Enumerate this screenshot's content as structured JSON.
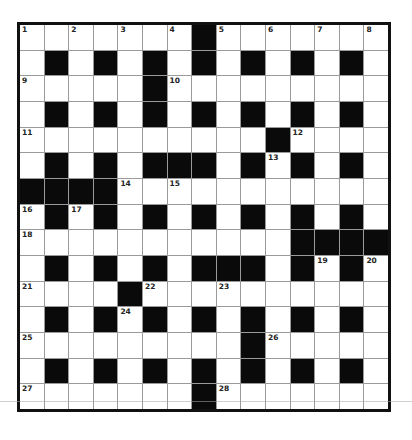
{
  "puzzle": {
    "rows": 15,
    "cols": 15,
    "layout": [
      "WWWWWWWBWWWWWWW",
      "WBWBWBWBWBWBWBW",
      "WWWWWBWWWWWWWWW",
      "WBWBWBWBWBWBWBW",
      "WWWWWWWWWWBWWWW",
      "WBWBWBBBWBWBWBW",
      "BBBBWWWWWWWWWWW",
      "WBWBWBWBWBWBWBW",
      "WWWWWWWWWWWBBBB",
      "WBWBWBWBBBWBWBW",
      "WWWWBWWWWWWWWWW",
      "WBWBWBWBWBWBWBW",
      "WWWWWWWWWBWWWWW",
      "WBWBWBWBWBWBWBW",
      "WWWWWWWBWWWWWWW"
    ],
    "numbers": [
      {
        "r": 0,
        "c": 0,
        "n": "1"
      },
      {
        "r": 0,
        "c": 2,
        "n": "2"
      },
      {
        "r": 0,
        "c": 4,
        "n": "3"
      },
      {
        "r": 0,
        "c": 6,
        "n": "4"
      },
      {
        "r": 0,
        "c": 8,
        "n": "5"
      },
      {
        "r": 0,
        "c": 10,
        "n": "6"
      },
      {
        "r": 0,
        "c": 12,
        "n": "7"
      },
      {
        "r": 0,
        "c": 14,
        "n": "8"
      },
      {
        "r": 2,
        "c": 0,
        "n": "9"
      },
      {
        "r": 2,
        "c": 6,
        "n": "10"
      },
      {
        "r": 4,
        "c": 0,
        "n": "11"
      },
      {
        "r": 4,
        "c": 11,
        "n": "12"
      },
      {
        "r": 5,
        "c": 10,
        "n": "13"
      },
      {
        "r": 6,
        "c": 4,
        "n": "14"
      },
      {
        "r": 6,
        "c": 6,
        "n": "15"
      },
      {
        "r": 7,
        "c": 0,
        "n": "16"
      },
      {
        "r": 7,
        "c": 2,
        "n": "17"
      },
      {
        "r": 8,
        "c": 0,
        "n": "18"
      },
      {
        "r": 9,
        "c": 12,
        "n": "19"
      },
      {
        "r": 9,
        "c": 14,
        "n": "20"
      },
      {
        "r": 10,
        "c": 0,
        "n": "21"
      },
      {
        "r": 10,
        "c": 5,
        "n": "22"
      },
      {
        "r": 10,
        "c": 8,
        "n": "23"
      },
      {
        "r": 11,
        "c": 4,
        "n": "24"
      },
      {
        "r": 12,
        "c": 0,
        "n": "25"
      },
      {
        "r": 12,
        "c": 10,
        "n": "26"
      },
      {
        "r": 14,
        "c": 0,
        "n": "27"
      },
      {
        "r": 14,
        "c": 8,
        "n": "28"
      }
    ],
    "colors": {
      "block": "#0a0a0a",
      "open": "#ffffff",
      "border": "#111111",
      "gridline": "#9a9a9a"
    }
  }
}
